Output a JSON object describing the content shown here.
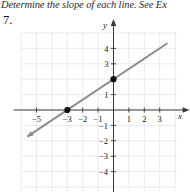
{
  "instruction": "Determine the slope of each line. See Ex",
  "problem_number": "7.",
  "colors": {
    "background": "#ffffff",
    "grid": "#e2e6ee",
    "axis": "#3a3a3a",
    "line": "#8a8a8a",
    "point": "#111111",
    "text": "#1a1a1a"
  },
  "chart_data": {
    "type": "line",
    "title": "",
    "xlabel": "x",
    "ylabel": "y",
    "grid": true,
    "legend": false,
    "xlim": [
      -6,
      4
    ],
    "ylim": [
      -5,
      5
    ],
    "x_ticks": [
      -5,
      -3,
      -2,
      -1,
      1,
      2,
      3
    ],
    "x_tick_labels": [
      "-5",
      "-3",
      "-2",
      "-1",
      "1",
      "2",
      "3"
    ],
    "y_ticks": [
      4,
      3,
      1,
      -1,
      -2,
      -3,
      -4
    ],
    "y_tick_labels": [
      "4",
      "3",
      "1",
      "-1",
      "-2",
      "-3",
      "-4"
    ],
    "series": [
      {
        "name": "line",
        "type": "line",
        "slope": 0.6666666667,
        "intercept": 2,
        "x": [
          -5.6,
          3.5
        ],
        "y": [
          -1.73,
          4.33
        ],
        "arrow_start": true,
        "arrow_end": false
      }
    ],
    "points": [
      {
        "label": "x-intercept",
        "x": -3,
        "y": 0
      },
      {
        "label": "y-intercept",
        "x": 0,
        "y": 2
      }
    ]
  }
}
